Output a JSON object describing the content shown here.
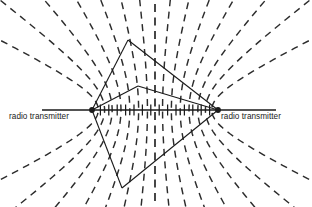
{
  "figure": {
    "type": "hyperbolic-navigation-diagram",
    "background_color": "#ffffff",
    "ink_color": "#1a1a1a",
    "width": 312,
    "height": 207
  },
  "labels": {
    "left_transmitter": "radio transmitter",
    "right_transmitter": "radio transmitter"
  },
  "chart_data": {
    "type": "line",
    "title": "",
    "xlabel": "",
    "ylabel": "",
    "grid": false,
    "legend": "none",
    "annotations": [
      "radio transmitter",
      "radio transmitter"
    ],
    "foci": [
      {
        "name": "left-transmitter",
        "x": 92,
        "y": 110
      },
      {
        "name": "right-transmitter",
        "x": 218,
        "y": 110
      }
    ],
    "baseline": {
      "x1": 42,
      "y1": 110,
      "x2": 276,
      "y2": 110,
      "tick_count": 14
    },
    "center_line": {
      "x": 155,
      "style": "dashed",
      "note": "perpendicular bisector"
    },
    "hyperbola_family": {
      "style": "dashed",
      "count_per_side": 7,
      "k_values": [
        0.12,
        0.26,
        0.4,
        0.54,
        0.68,
        0.8,
        0.9
      ]
    },
    "fix_triangles": [
      {
        "name": "upper-fix",
        "apex_x": 128,
        "apex_y": 40
      },
      {
        "name": "mid-fix",
        "apex_x": 138,
        "apex_y": 86
      },
      {
        "name": "lower-fix",
        "apex_x": 122,
        "apex_y": 188
      }
    ]
  }
}
